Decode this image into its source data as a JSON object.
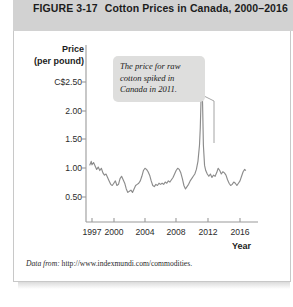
{
  "header": {
    "figure_number": "FIGURE  3-17",
    "title": "Cotton Prices in Canada, 2000–2016",
    "full_title": "FIGURE  3-17   Cotton Prices in Canada, 2000–2016",
    "band_color": "#d2d2d2"
  },
  "source": {
    "label": "Data from:",
    "url": "http://www.indexmundi.com/commodities."
  },
  "annotation": {
    "text": "The price for raw cotton spiked in Canada in 2011.",
    "line1": "The price for raw",
    "line2": "cotton spiked in",
    "line3": "Canada in 2011.",
    "box_color": "#dededd",
    "leader_target_year": 2011
  },
  "chart_data": {
    "type": "line",
    "title": "Cotton Prices in Canada, 2000–2016",
    "xlabel": "Year",
    "ylabel": "Price (per pound)",
    "ylabel_line1": "Price",
    "ylabel_line2": "(per pound)",
    "y_tick_labels": [
      "C$2.50",
      "2.00",
      "1.50",
      "1.00",
      "0.50"
    ],
    "y_ticks": [
      2.5,
      2.0,
      1.5,
      1.0,
      0.5
    ],
    "x_tick_labels": [
      "1997",
      "2000",
      "2004",
      "2008",
      "2012",
      "2016"
    ],
    "x_ticks": [
      1997,
      2000,
      2004,
      2008,
      2012,
      2016
    ],
    "xlim": [
      1996.6,
      2016.8
    ],
    "ylim": [
      0.0,
      2.7
    ],
    "grid": false,
    "legend": false,
    "line_color": "#8c8c8c",
    "currency": "C$",
    "series": [
      {
        "name": "Cotton price (C$ per pound)",
        "x": [
          1996.7,
          1996.9,
          1997.0,
          1997.2,
          1997.4,
          1997.6,
          1997.8,
          1998.0,
          1998.2,
          1998.4,
          1998.6,
          1998.8,
          1999.0,
          1999.2,
          1999.4,
          1999.6,
          1999.8,
          2000.0,
          2000.2,
          2000.4,
          2000.6,
          2000.8,
          2001.0,
          2001.2,
          2001.4,
          2001.6,
          2001.8,
          2002.0,
          2002.2,
          2002.4,
          2002.6,
          2002.8,
          2003.0,
          2003.2,
          2003.4,
          2003.6,
          2003.8,
          2004.0,
          2004.2,
          2004.4,
          2004.6,
          2004.8,
          2005.0,
          2005.2,
          2005.4,
          2005.6,
          2005.8,
          2006.0,
          2006.2,
          2006.4,
          2006.6,
          2006.8,
          2007.0,
          2007.2,
          2007.4,
          2007.6,
          2007.8,
          2008.0,
          2008.2,
          2008.4,
          2008.6,
          2008.8,
          2009.0,
          2009.2,
          2009.4,
          2009.6,
          2009.8,
          2010.0,
          2010.2,
          2010.4,
          2010.6,
          2010.8,
          2010.9,
          2011.0,
          2011.1,
          2011.2,
          2011.3,
          2011.45,
          2011.6,
          2011.8,
          2012.0,
          2012.2,
          2012.4,
          2012.6,
          2012.8,
          2013.0,
          2013.2,
          2013.4,
          2013.6,
          2013.8,
          2014.0,
          2014.2,
          2014.4,
          2014.6,
          2014.8,
          2015.0,
          2015.2,
          2015.4,
          2015.6,
          2015.8,
          2016.0,
          2016.2,
          2016.4,
          2016.6,
          2016.75
        ],
        "values": [
          1.05,
          1.12,
          1.06,
          1.1,
          1.04,
          0.98,
          1.02,
          0.96,
          1.0,
          0.92,
          0.88,
          0.9,
          0.84,
          0.78,
          0.72,
          0.7,
          0.74,
          0.78,
          0.7,
          0.72,
          0.82,
          0.86,
          0.8,
          0.74,
          0.64,
          0.58,
          0.6,
          0.62,
          0.58,
          0.64,
          0.7,
          0.72,
          0.74,
          0.78,
          0.86,
          0.96,
          1.0,
          0.98,
          0.94,
          0.88,
          0.78,
          0.7,
          0.68,
          0.72,
          0.7,
          0.74,
          0.72,
          0.74,
          0.72,
          0.76,
          0.74,
          0.78,
          0.76,
          0.8,
          0.84,
          0.9,
          0.96,
          1.0,
          0.98,
          0.92,
          0.82,
          0.7,
          0.64,
          0.68,
          0.72,
          0.78,
          0.82,
          0.86,
          0.9,
          0.98,
          1.12,
          1.4,
          1.7,
          2.2,
          2.56,
          2.1,
          1.4,
          1.05,
          0.96,
          0.9,
          0.86,
          0.9,
          0.84,
          0.88,
          0.86,
          0.92,
          1.0,
          0.96,
          0.9,
          0.94,
          0.92,
          0.88,
          0.8,
          0.74,
          0.7,
          0.72,
          0.76,
          0.74,
          0.7,
          0.74,
          0.78,
          0.86,
          0.94,
          0.98,
          0.96
        ]
      }
    ],
    "annotations": [
      {
        "text": "The price for raw cotton spiked in Canada in 2011.",
        "points_to_x": 2011,
        "points_to_y": 2.56
      }
    ],
    "peak": {
      "year": 2011,
      "value": 2.56
    },
    "axis_color": "#9a9a9a"
  }
}
